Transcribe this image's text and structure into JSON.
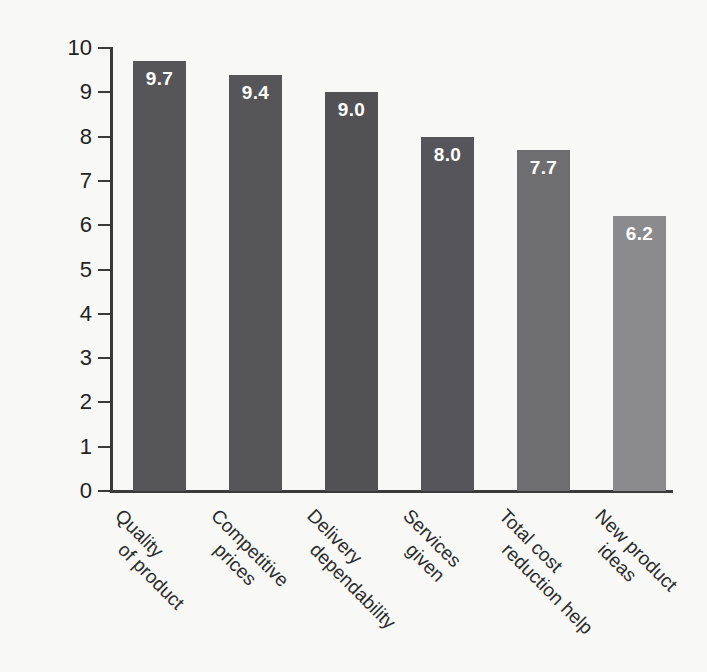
{
  "chart_data": {
    "type": "bar",
    "title": "",
    "subtitle": "",
    "xlabel": "",
    "ylabel": "Ranking of Importance",
    "ylim": [
      0,
      10
    ],
    "ytick_labels": [
      "10",
      "9",
      "8",
      "7",
      "6",
      "5",
      "4",
      "3",
      "2",
      "1",
      "0"
    ],
    "yticks": [
      10,
      9,
      8,
      7,
      6,
      5,
      4,
      3,
      2,
      1,
      0
    ],
    "grid": false,
    "legend": false,
    "legend_position": "none",
    "categories": [
      "Quality of product",
      "Competitive prices",
      "Delivery dependability",
      "Services given",
      "Total cost reduction help",
      "New product ideas"
    ],
    "category_lines": [
      [
        "Quality",
        "of product"
      ],
      [
        "Competitive",
        "prices"
      ],
      [
        "Delivery",
        "dependability"
      ],
      [
        "Services",
        "given"
      ],
      [
        "Total cost",
        "reduction help"
      ],
      [
        "New product",
        "ideas"
      ]
    ],
    "values": [
      9.7,
      9.4,
      9.0,
      8.0,
      7.7,
      6.2
    ],
    "value_labels": [
      "9.7",
      "9.4",
      "9.0",
      "8.0",
      "7.7",
      "6.2"
    ],
    "bar_colors": [
      "#565658",
      "#565658",
      "#525255",
      "#56565a",
      "#6e6e70",
      "#8b8b8d"
    ],
    "value_label_color": "#ffffff",
    "axis_color": "#3a3a3a",
    "background_color": "#f8f8f6",
    "text_color": "#232323"
  }
}
